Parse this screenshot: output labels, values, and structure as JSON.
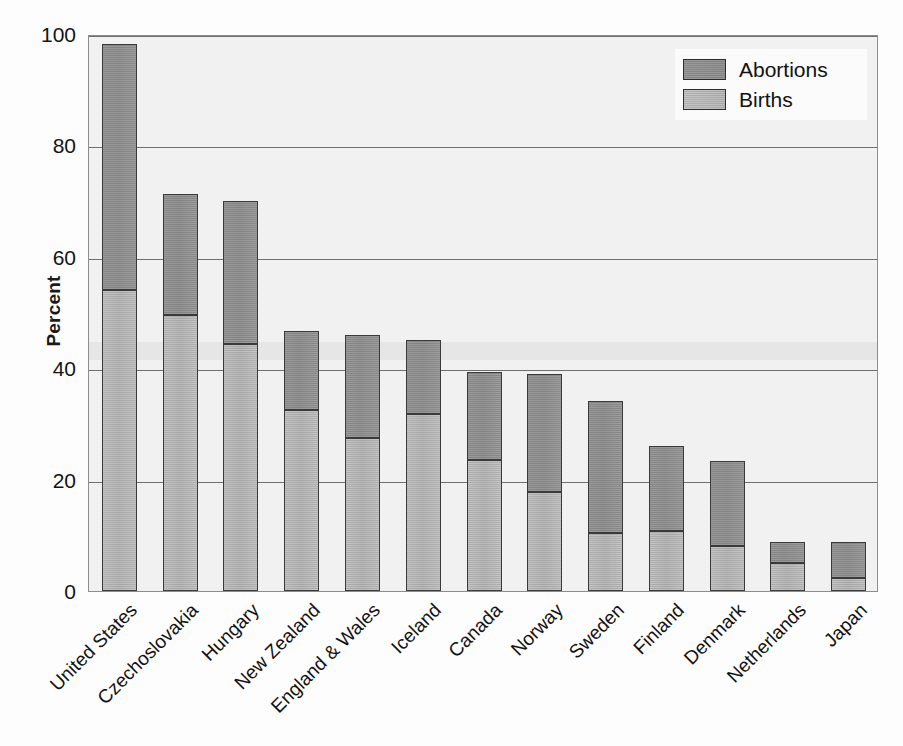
{
  "chart_data": {
    "type": "bar",
    "stacked": true,
    "title": "",
    "subtitle": "",
    "xlabel": "",
    "ylabel": "Percent",
    "ylim": [
      0,
      100
    ],
    "yticks": [
      0,
      20,
      40,
      60,
      80,
      100
    ],
    "grid": true,
    "legend_position": "top-right",
    "categories": [
      "United States",
      "Czechoslovakia",
      "Hungary",
      "New Zealand",
      "England & Wales",
      "Iceland",
      "Canada",
      "Norway",
      "Sweden",
      "Finland",
      "Denmark",
      "Netherlands",
      "Japan"
    ],
    "series": [
      {
        "name": "Births",
        "color": "#aeaeae",
        "values": [
          54.0,
          49.5,
          44.3,
          32.5,
          27.5,
          31.8,
          23.5,
          17.8,
          10.5,
          10.8,
          8.0,
          5.0,
          2.3
        ]
      },
      {
        "name": "Abortions",
        "color": "#8c8c8c",
        "values": [
          44.2,
          21.8,
          25.8,
          14.2,
          18.5,
          13.2,
          15.8,
          21.1,
          23.7,
          15.2,
          15.3,
          3.8,
          6.5
        ]
      }
    ],
    "totals": [
      98.2,
      71.3,
      70.1,
      46.7,
      46.0,
      45.0,
      39.3,
      38.9,
      34.2,
      26.0,
      23.3,
      8.8,
      8.8
    ]
  },
  "legend": {
    "entries": [
      {
        "label": "Abortions",
        "swatch": "abortions"
      },
      {
        "label": "Births",
        "swatch": "births"
      }
    ]
  },
  "axes": {
    "y_title": "Percent",
    "y_tick_labels": [
      "100",
      "80",
      "60",
      "40",
      "20",
      "0"
    ]
  },
  "colors": {
    "abortions": "#8c8c8c",
    "births": "#aeaeae",
    "plot_background": "#f1f1f1",
    "gridline": "#6f6f6f",
    "axis": "#8d8d8d",
    "text": "#121212"
  }
}
